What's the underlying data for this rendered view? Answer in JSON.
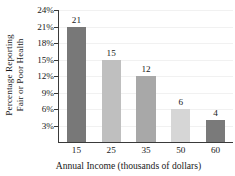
{
  "chart_data": {
    "type": "bar",
    "title": "",
    "categories": [
      "15",
      "25",
      "35",
      "50",
      "60"
    ],
    "values": [
      21,
      15,
      12,
      6,
      4
    ],
    "value_labels": [
      "21",
      "15",
      "12",
      "6",
      "4"
    ],
    "xlabel": "Annual Income (thousands of dollars)",
    "ylabel_line1": "Percentage Reporting",
    "ylabel_line2": "Fair or Poor Health",
    "ylim": [
      0,
      24
    ],
    "yticks": [
      24,
      21,
      18,
      15,
      12,
      9,
      6,
      3
    ],
    "ytick_labels": [
      "24%",
      "21%",
      "18%",
      "15%",
      "12%",
      "9%",
      "6%",
      "3%"
    ],
    "grid": true,
    "legend": false,
    "bar_colors": [
      "#787878",
      "#bfbfbf",
      "#a8a8a8",
      "#d6d6d6",
      "#7a7a7a"
    ],
    "axis_color": "#3a3a3a",
    "grid_color": "#f1f1f1",
    "background": "#ffffff"
  }
}
